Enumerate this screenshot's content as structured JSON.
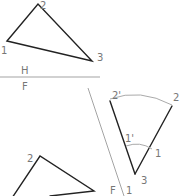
{
  "diagram": {
    "top_view": {
      "vertices": [
        {
          "label": "1",
          "x": 6,
          "y": 41
        },
        {
          "label": "2",
          "x": 38,
          "y": 4
        },
        {
          "label": "3",
          "x": 92,
          "y": 61
        }
      ]
    },
    "fold_line_hf": {
      "upper_label": "H",
      "lower_label": "F"
    },
    "fold_line_f1": {
      "left_label": "F",
      "right_label": "1"
    },
    "revolved_view": {
      "labels": {
        "v2prime": "2'",
        "v2": "2",
        "v1prime": "1'",
        "v1": "1",
        "v3": "3"
      }
    },
    "bottom_view": {
      "labels": {
        "v2": "2"
      }
    }
  }
}
